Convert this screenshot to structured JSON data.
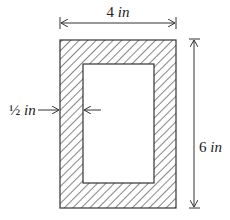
{
  "figure": {
    "type": "cross-section",
    "outer": {
      "width_label": "4 in",
      "height_label": "6 in"
    },
    "wall": {
      "thickness_label": "½ in"
    }
  },
  "labels": {
    "width_num": "4",
    "width_unit": "in",
    "height_num": "6",
    "height_unit": "in",
    "wall_num": "½",
    "wall_unit": "in"
  },
  "colors": {
    "stroke": "#333333",
    "hatch": "#444444",
    "background": "#ffffff"
  }
}
